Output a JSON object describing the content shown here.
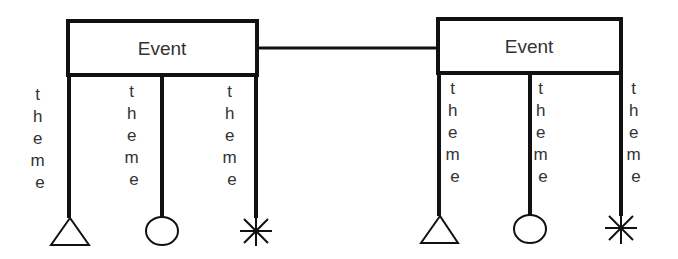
{
  "diagram": {
    "colors": {
      "stroke": "#111111",
      "text": "#333333",
      "background": "#ffffff"
    },
    "connector": {
      "x1": 257,
      "x2": 437,
      "y": 48
    },
    "events": [
      {
        "label": "Event",
        "box": {
          "x": 67,
          "y": 20,
          "w": 190,
          "h": 55
        },
        "themes": [
          {
            "label_letters": [
              "t",
              "h",
              "e",
              "m",
              "e"
            ],
            "label": "theme",
            "text_x": 40,
            "line_x": 70,
            "end": "triangle"
          },
          {
            "label_letters": [
              "t",
              "h",
              "e",
              "m",
              "e"
            ],
            "label": "theme",
            "text_x": 134,
            "line_x": 162,
            "end": "circle"
          },
          {
            "label_letters": [
              "t",
              "h",
              "e",
              "m",
              "e"
            ],
            "label": "theme",
            "text_x": 232,
            "line_x": 256,
            "end": "asterisk"
          }
        ]
      },
      {
        "label": "Event",
        "box": {
          "x": 437,
          "y": 18,
          "w": 184,
          "h": 55
        },
        "themes": [
          {
            "label_letters": [
              "t",
              "h",
              "e",
              "m",
              "e"
            ],
            "label": "theme",
            "text_x": 455,
            "line_x": 439,
            "end": "triangle"
          },
          {
            "label_letters": [
              "t",
              "h",
              "e",
              "m",
              "e"
            ],
            "label": "theme",
            "text_x": 543,
            "line_x": 530,
            "end": "circle"
          },
          {
            "label_letters": [
              "t",
              "h",
              "e",
              "m",
              "e"
            ],
            "label": "theme",
            "text_x": 636,
            "line_x": 621,
            "end": "asterisk"
          }
        ]
      }
    ]
  }
}
